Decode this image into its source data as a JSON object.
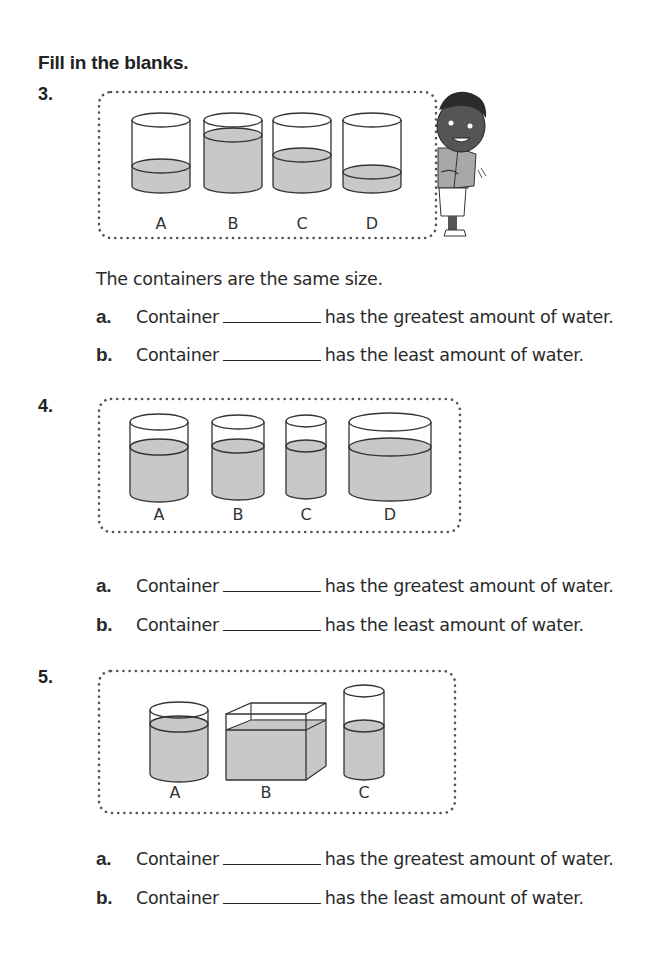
{
  "heading": "Fill in the blanks.",
  "colors": {
    "water": "#c8c8c8",
    "outline": "#333333",
    "dots": "#555555"
  },
  "problems": [
    {
      "number": "3.",
      "note": "The containers are the same size.",
      "labels": [
        "A",
        "B",
        "C",
        "D"
      ],
      "questions": [
        {
          "letter": "a.",
          "prefix": "Container",
          "answer": "",
          "suffix": "has the greatest amount of water."
        },
        {
          "letter": "b.",
          "prefix": "Container",
          "answer": "",
          "suffix": "has the least amount of water."
        }
      ]
    },
    {
      "number": "4.",
      "labels": [
        "A",
        "B",
        "C",
        "D"
      ],
      "questions": [
        {
          "letter": "a.",
          "prefix": "Container",
          "answer": "",
          "suffix": "has the greatest amount of water."
        },
        {
          "letter": "b.",
          "prefix": "Container",
          "answer": "",
          "suffix": "has the least amount of water."
        }
      ]
    },
    {
      "number": "5.",
      "labels": [
        "A",
        "B",
        "C"
      ],
      "questions": [
        {
          "letter": "a.",
          "prefix": "Container",
          "answer": "",
          "suffix": "has the greatest amount of water."
        },
        {
          "letter": "b.",
          "prefix": "Container",
          "answer": "",
          "suffix": "has the least amount of water."
        }
      ]
    }
  ]
}
